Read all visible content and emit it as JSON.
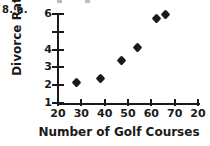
{
  "problem": {
    "label": "8. a."
  },
  "chart_data": {
    "type": "scatter",
    "title": "",
    "xlabel": "Number of Golf Courses",
    "ylabel": "Divorce Rate",
    "xlim": [
      20,
      80
    ],
    "ylim": [
      1,
      6
    ],
    "grid": false,
    "legend": null,
    "x_tick_labels": [
      "20",
      "30",
      "40",
      "50",
      "60",
      "70",
      "20"
    ],
    "x_tick_values": [
      20,
      30,
      40,
      50,
      60,
      70,
      80
    ],
    "y_tick_labels": [
      "6",
      "",
      "4",
      "3",
      "2",
      "1"
    ],
    "y_tick_values": [
      6,
      5,
      4,
      3,
      2,
      1
    ],
    "x": [
      28,
      38,
      47,
      54,
      62,
      66
    ],
    "y": [
      2.15,
      2.4,
      3.4,
      4.1,
      5.75,
      6.0
    ],
    "points": [
      {
        "x": 28,
        "y": 2.15
      },
      {
        "x": 38,
        "y": 2.4
      },
      {
        "x": 47,
        "y": 3.4
      },
      {
        "x": 54,
        "y": 4.1
      },
      {
        "x": 62,
        "y": 5.75
      },
      {
        "x": 66,
        "y": 6.0
      }
    ],
    "marker": "diamond",
    "marker_color": "#1a1a1a"
  },
  "artifacts": {
    "clipped_marks_top": [
      {
        "left": 57
      },
      {
        "left": 85
      }
    ]
  }
}
